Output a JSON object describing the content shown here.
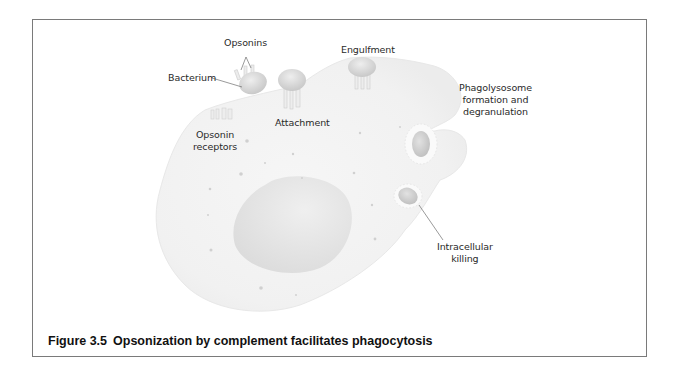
{
  "figure": {
    "number": "Figure 3.5",
    "caption": "Opsonization by complement facilitates phagocytosis"
  },
  "labels": {
    "opsonins": "Opsonins",
    "bacterium": "Bacterium",
    "opsonin_receptors_line1": "Opsonin",
    "opsonin_receptors_line2": "receptors",
    "attachment": "Attachment",
    "engulfment": "Engulfment",
    "phagolysosome_line1": "Phagolysosome",
    "phagolysosome_line2": "formation and",
    "phagolysosome_line3": "degranulation",
    "killing_line1": "Intracellular",
    "killing_line2": "killing"
  },
  "colors": {
    "frame_border": "#7a7a7a",
    "cell_fill": "#f3f3f3",
    "nucleus_fill": "#e4e4e4",
    "bacterium_fill": "#d9d9d9",
    "text": "#2a2a2a"
  }
}
